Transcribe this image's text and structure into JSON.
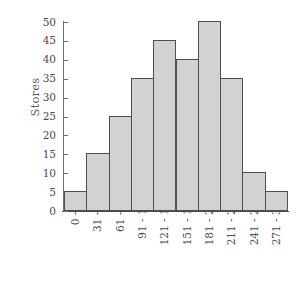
{
  "chart_data": {
    "type": "bar",
    "title": "",
    "subtitle": "",
    "xlabel": "",
    "ylabel": "Stores",
    "categories": [
      "0 - 30",
      "31 - 60",
      "61 - 90",
      "91 - 120",
      "121 - 150",
      "151 - 180",
      "181 - 210",
      "211 - 240",
      "241 - 270",
      "271 - 300"
    ],
    "values": [
      5,
      15,
      25,
      35,
      45,
      40,
      50,
      35,
      10,
      5
    ],
    "ylim": [
      0,
      50
    ],
    "yticks": [
      0,
      5,
      10,
      15,
      20,
      25,
      30,
      35,
      40,
      45,
      50
    ],
    "ytick_labels": [
      "0",
      "5",
      "10",
      "15",
      "20",
      "25",
      "30",
      "35",
      "40",
      "45",
      "50"
    ],
    "grid": false,
    "legend": null,
    "legend_position": "none",
    "bar_gap": 0,
    "colors": {
      "bar_fill": "#d2d2d2",
      "bar_edge": "#4f4f4f",
      "axis": "#4a4a4a",
      "tick_text": "#4a4a4a",
      "axis_title": "#5b5b5b",
      "background": "#ffffff"
    }
  }
}
